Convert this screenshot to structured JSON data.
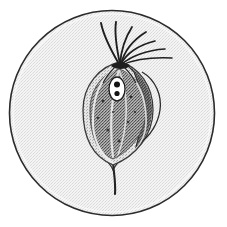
{
  "figure": {
    "title": "Flagellated protozoan in microscope field",
    "view": "circular microscope field of view",
    "style": "stippled pen-and-ink scientific illustration",
    "background_color": "#ffffff"
  },
  "field": {
    "label": "microscope-field",
    "shape": "circle",
    "center_x": 112,
    "center_y": 113,
    "radius": 103,
    "fill_color": "#f1f1f1",
    "stroke_color": "#2b2b2b",
    "stroke_width": 1.6,
    "stipple": "fine light halftone"
  },
  "cell": {
    "label": "cell-body",
    "shape": "ovoid teardrop",
    "outline_color": "#2f2f2f",
    "membrane_fill": "#e8e8e8",
    "cytoplasm_fill": "#8d8d8d",
    "stipple": "dense dark stipple",
    "center_x": 118,
    "center_y": 112,
    "width": 62,
    "height": 100,
    "apex_x": 120,
    "apex_y": 63,
    "base_x": 113,
    "base_y": 163
  },
  "undulating_lobe": {
    "label": "undulating-membrane-lobe",
    "position": "upper right of cell body",
    "fill_color": "#5e5e5e",
    "outline_color": "#2b2b2b"
  },
  "nucleus": {
    "label": "nucleus",
    "shape": "oval",
    "fill_color": "#ffffff",
    "outline_color": "#1e1e1e",
    "center_x": 117,
    "center_y": 89,
    "rx": 8,
    "ry": 12,
    "endosome_count": 2,
    "endosome_color": "#141414"
  },
  "anterior_flagella": {
    "label": "anterior-flagella",
    "count": 7,
    "origin_x": 120,
    "origin_y": 63,
    "color": "#1f1f1f",
    "description": "fan of free anterior flagella curving up and to the right"
  },
  "posterior_flagellum": {
    "label": "posterior-flagellum",
    "origin_x": 113,
    "origin_y": 163,
    "tip_x": 115,
    "tip_y": 193,
    "color": "#1f1f1f",
    "description": "single trailing flagellum extending below the cell"
  },
  "axostyle": {
    "label": "axostyle",
    "color": "#d8d8d8",
    "description": "pale longitudinal rod running through the cytoplasm"
  },
  "colors": {
    "ink": "#1f1f1f",
    "field_fill": "#f1f1f1",
    "cytoplasm": "#8d8d8d",
    "membrane": "#e8e8e8",
    "nucleus": "#ffffff",
    "lobe": "#5e5e5e",
    "paper": "#ffffff"
  }
}
